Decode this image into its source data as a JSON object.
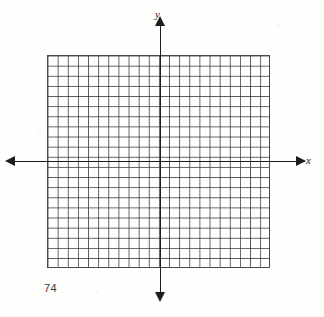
{
  "page": {
    "page_number": "74",
    "background_color": "#fefefd"
  },
  "figure": {
    "name": "blank-coordinate-plane",
    "axis_labels": {
      "x": "x",
      "y": "y"
    },
    "axis_color": "#1d1d1d",
    "grid_color": "#3c3c3c",
    "grid_background": "#ffffff"
  },
  "chart_data": {
    "type": "scatter",
    "title": "",
    "subtitle": "",
    "xlabel": "x",
    "ylabel": "y",
    "series": [
      {
        "name": "",
        "x": [],
        "y": []
      }
    ],
    "grid": true,
    "grid_columns": 22,
    "grid_rows": 21,
    "cell_size_px": 10.14,
    "origin_cell_from_left": 11,
    "origin_cell_from_top": 10,
    "xlim": [
      -11,
      11
    ],
    "ylim": [
      -11,
      10
    ],
    "xticks": [],
    "yticks": [],
    "tick_labels_shown": false,
    "legend": null,
    "annotations": []
  }
}
